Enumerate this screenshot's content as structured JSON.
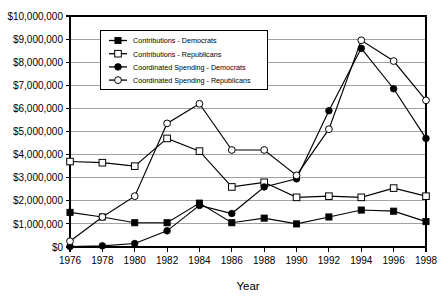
{
  "chart_data": {
    "type": "line",
    "title": "",
    "xlabel": "Year",
    "ylabel": "",
    "grid": true,
    "legend_position": "top-center-inside",
    "categories": [
      1976,
      1978,
      1980,
      1982,
      1984,
      1986,
      1988,
      1990,
      1992,
      1994,
      1996,
      1998
    ],
    "xtick_labels": [
      "1976",
      "1978",
      "1980",
      "1982",
      "1984",
      "1986",
      "1988",
      "1990",
      "1992",
      "1994",
      "1996",
      "1998"
    ],
    "ylim": [
      0,
      10000000
    ],
    "ytick_values": [
      0,
      1000000,
      2000000,
      3000000,
      4000000,
      5000000,
      6000000,
      7000000,
      8000000,
      9000000,
      10000000
    ],
    "ytick_labels": [
      "$0",
      "$1,000,000",
      "$2,000,000",
      "$3,000,000",
      "$4,000,000",
      "$5,000,000",
      "$6,000,000",
      "$7,000,000",
      "$8,000,000",
      "$9,000,000",
      "$10,000,000"
    ],
    "series": [
      {
        "name": "Contributions - Democrats",
        "marker": "filled-square",
        "values": [
          1500000,
          1300000,
          1050000,
          1050000,
          1900000,
          1050000,
          1250000,
          1000000,
          1300000,
          1600000,
          1550000,
          1100000
        ]
      },
      {
        "name": "Contributions  -  Republicans",
        "marker": "open-square",
        "values": [
          3700000,
          3650000,
          3500000,
          4700000,
          4150000,
          2600000,
          2800000,
          2150000,
          2200000,
          2150000,
          2550000,
          2200000
        ]
      },
      {
        "name": "Coordinated Spending - Democrats",
        "marker": "filled-circle",
        "values": [
          20000,
          50000,
          150000,
          700000,
          1800000,
          1450000,
          2600000,
          2950000,
          5900000,
          8600000,
          6850000,
          4700000
        ]
      },
      {
        "name": "Coordinated Spending - Republicans",
        "marker": "open-circle",
        "values": [
          250000,
          1300000,
          2200000,
          5350000,
          6200000,
          4200000,
          4200000,
          3100000,
          5100000,
          8950000,
          8050000,
          6350000
        ]
      }
    ]
  },
  "legend": {
    "items": [
      {
        "label": "Contributions - Democrats",
        "marker": "filled-square"
      },
      {
        "label": "Contributions  -  Republicans",
        "marker": "open-square"
      },
      {
        "label": "Coordinated Spending - Democrats",
        "marker": "filled-circle"
      },
      {
        "label": "Coordinated Spending - Republicans",
        "marker": "open-circle"
      }
    ]
  },
  "colors": {
    "line": "#000000",
    "grid": "#8a8a8a",
    "frame": "#000000",
    "background": "#ffffff",
    "text": "#000000"
  }
}
